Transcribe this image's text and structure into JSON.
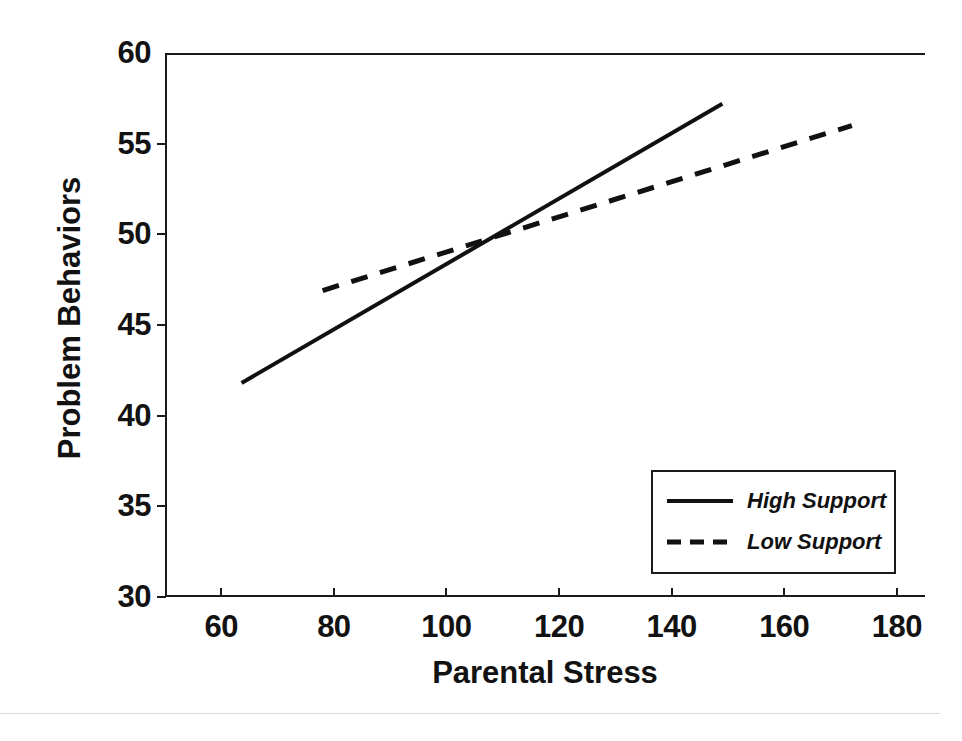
{
  "figure": {
    "scan_artifact_top": "",
    "axis_line_color": "#1a1a1a"
  },
  "chart_data": {
    "type": "line",
    "title": "",
    "xlabel": "Parental Stress",
    "ylabel": "Problem Behaviors",
    "xlim": [
      50,
      185
    ],
    "ylim": [
      30,
      60
    ],
    "xticks": [
      60,
      80,
      100,
      120,
      140,
      160,
      180
    ],
    "xtick_labels": [
      "60",
      "80",
      "100",
      "120",
      "140",
      "160",
      "180"
    ],
    "yticks": [
      30,
      35,
      40,
      45,
      50,
      55,
      60
    ],
    "ytick_labels": [
      "30",
      "35",
      "40",
      "45",
      "50",
      "55",
      "60"
    ],
    "grid": false,
    "legend_position": "lower right",
    "series": [
      {
        "name": "High Support",
        "style": "solid",
        "color": "#111111",
        "x": [
          63.6,
          149.0
        ],
        "y": [
          41.8,
          57.2
        ]
      },
      {
        "name": "Low Support",
        "style": "dashed",
        "color": "#111111",
        "x": [
          78.0,
          172.0
        ],
        "y": [
          46.9,
          56.0
        ]
      }
    ],
    "annotations": []
  },
  "legend": {
    "entries": [
      {
        "label": "High Support",
        "style": "solid"
      },
      {
        "label": "Low Support",
        "style": "dashed"
      }
    ]
  }
}
